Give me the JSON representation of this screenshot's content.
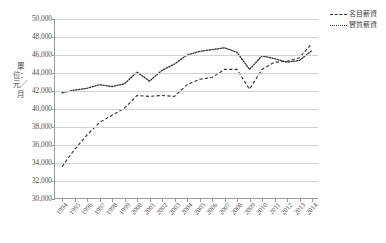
{
  "chart_data": {
    "type": "line",
    "title": "",
    "xlabel": "",
    "ylabel": "單位：元／月",
    "ylim": [
      30000,
      50000
    ],
    "ytick_step": 2000,
    "yticks": [
      "30,000",
      "32,000",
      "34,000",
      "36,000",
      "38,000",
      "40,000",
      "42,000",
      "44,000",
      "46,000",
      "48,000",
      "50,000"
    ],
    "ytick_values": [
      30000,
      32000,
      34000,
      36000,
      38000,
      40000,
      42000,
      44000,
      46000,
      48000,
      50000
    ],
    "grid": true,
    "legend_position": "right-top",
    "categories": [
      "1994",
      "1995",
      "1996",
      "1997",
      "1998",
      "1999",
      "2000",
      "2001",
      "2002",
      "2003",
      "2004",
      "2005",
      "2006",
      "2007",
      "2008",
      "2009",
      "2010",
      "2011",
      "2012",
      "2013",
      "2014"
    ],
    "series": [
      {
        "name": "名目薪資",
        "style": "dashed",
        "values": [
          33600,
          35500,
          37100,
          38500,
          39300,
          40100,
          41500,
          41400,
          41500,
          41400,
          42700,
          43300,
          43500,
          44400,
          44400,
          42200,
          44400,
          45200,
          45300,
          45700,
          47300
        ]
      },
      {
        "name": "實質薪資",
        "style": "dotted",
        "values": [
          41800,
          42100,
          42300,
          42700,
          42500,
          42800,
          44100,
          43100,
          44300,
          45000,
          46000,
          46400,
          46600,
          46800,
          46300,
          44400,
          45900,
          45600,
          45200,
          45400,
          46500
        ]
      }
    ]
  },
  "legend": {
    "items": [
      {
        "label": "名目薪資",
        "style": "dashed"
      },
      {
        "label": "實質薪資",
        "style": "dotted"
      }
    ]
  }
}
